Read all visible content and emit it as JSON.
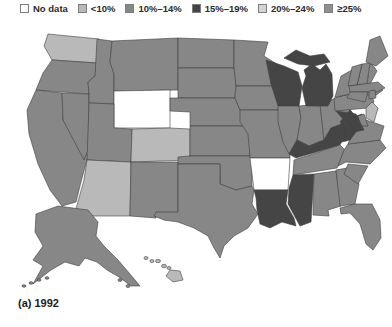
{
  "figure": {
    "caption": "(a) 1992"
  },
  "legend": {
    "items": [
      {
        "key": "no-data",
        "label": "No data",
        "color": "#ffffff"
      },
      {
        "key": "lt10",
        "label": "<10%",
        "color": "#b9b9b9"
      },
      {
        "key": "p10_14",
        "label": "10%–14%",
        "color": "#878787"
      },
      {
        "key": "p15_19",
        "label": "15%–19%",
        "color": "#454545"
      },
      {
        "key": "p20_24",
        "label": "20%–24%",
        "color": "#d4d4d4"
      },
      {
        "key": "ge25",
        "label": "≥25%",
        "color": "#8f8f8f"
      }
    ]
  },
  "map": {
    "stroke_color": "#3f3f3f",
    "background": "#ffffff",
    "states": {
      "WA": "lt10",
      "OR": "p10_14",
      "CA": "p10_14",
      "NV": "p10_14",
      "ID": "p10_14",
      "MT": "p10_14",
      "WY": "no-data",
      "UT": "p10_14",
      "CO": "lt10",
      "AZ": "lt10",
      "NM": "p10_14",
      "ND": "p10_14",
      "SD": "p10_14",
      "NE": "p10_14",
      "KS": "p10_14",
      "OK": "p10_14",
      "TX": "p10_14",
      "MN": "p10_14",
      "IA": "p10_14",
      "MO": "p10_14",
      "AR": "no-data",
      "LA": "p15_19",
      "WI": "p15_19",
      "IL": "p10_14",
      "IN": "p10_14",
      "OH": "p10_14",
      "MI": "p15_19",
      "KY": "p15_19",
      "TN": "p10_14",
      "MS": "p15_19",
      "AL": "p10_14",
      "GA": "p10_14",
      "FL": "p10_14",
      "SC": "p10_14",
      "NC": "p10_14",
      "VA": "p10_14",
      "WV": "p15_19",
      "PA": "p10_14",
      "NY": "p10_14",
      "VT": "p10_14",
      "NH": "p10_14",
      "ME": "p10_14",
      "MA": "p10_14",
      "CT": "p10_14",
      "RI": "p10_14",
      "NJ": "lt10",
      "DE": "p10_14",
      "MD": "p15_19",
      "AK": "p10_14",
      "HI": "lt10"
    }
  }
}
